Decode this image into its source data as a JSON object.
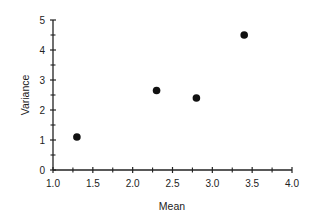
{
  "chart_data": {
    "type": "scatter",
    "title": "",
    "xlabel": "Mean",
    "ylabel": "Variance",
    "xlim": [
      1.0,
      4.0
    ],
    "ylim": [
      0,
      5
    ],
    "x_ticks": [
      1.0,
      1.5,
      2.0,
      2.5,
      3.0,
      3.5,
      4.0
    ],
    "x_tick_labels": [
      "1.0",
      "1.5",
      "2.0",
      "2.5",
      "3.0",
      "3.5",
      "4.0"
    ],
    "x_minor_ticks": [
      1.25,
      1.75,
      2.25,
      2.75,
      3.25,
      3.75
    ],
    "y_ticks": [
      0,
      1,
      2,
      3,
      4,
      5
    ],
    "y_tick_labels": [
      "0",
      "1",
      "2",
      "3",
      "4",
      "5"
    ],
    "y_minor_ticks": [
      0.5,
      1.5,
      2.5,
      3.5,
      4.5
    ],
    "grid": false,
    "legend": null,
    "series": [
      {
        "name": "data",
        "color": "#111111",
        "marker": "filled-circle",
        "points": [
          {
            "x": 1.3,
            "y": 1.1
          },
          {
            "x": 2.3,
            "y": 2.65
          },
          {
            "x": 2.8,
            "y": 2.4
          },
          {
            "x": 3.4,
            "y": 4.5
          }
        ]
      }
    ]
  },
  "colors": {
    "axis": "#222222",
    "marker": "#111111",
    "background": "#ffffff"
  }
}
